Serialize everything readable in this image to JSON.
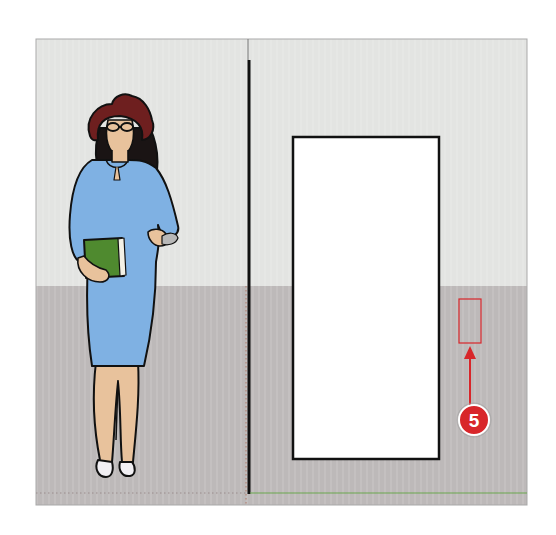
{
  "scene": {
    "description": "SketchUp-style elevation view: person figure beside a wall with a door opening; a red selection rectangle marks a point on the wall, called out by a numbered step badge",
    "colors": {
      "wall": "#e3e4e2",
      "floor": "#bdb9b9",
      "door": "#ffffff",
      "outline": "#111111",
      "callout": "#d8262a",
      "green_axis": "#6aa84f",
      "dress": "#7fb1e3",
      "hat": "#6e1f1f",
      "skin": "#e8c29c",
      "book": "#4f8a2f"
    }
  },
  "figure": {
    "name": "woman-figure",
    "holds": "green-book"
  },
  "door": {
    "name": "door-opening"
  },
  "callout": {
    "step_number": "5",
    "target": "selection-rectangle"
  }
}
